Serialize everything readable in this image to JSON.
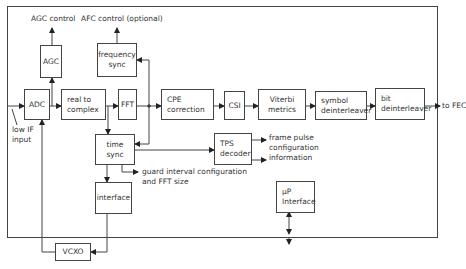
{
  "diagram": {
    "blocks": {
      "adc": "ADC",
      "agc": "AGC",
      "real_to_complex": [
        "real to",
        "complex"
      ],
      "fft": "FFT",
      "frequency_sync": [
        "frequency",
        "sync"
      ],
      "cpe_correction": [
        "CPE",
        "correction"
      ],
      "csi": "CSI",
      "viterbi_metrics": [
        "Viterbi",
        "metrics"
      ],
      "symbol_deinterleaver": [
        "symbol",
        "deinterleaver"
      ],
      "bit_deinterleaver": [
        "bit",
        "deinterleaver"
      ],
      "time_sync": [
        "time",
        "sync"
      ],
      "tps_decoder": [
        "TPS",
        "decoder"
      ],
      "interface": "interface",
      "up_interface": [
        "μP",
        "Interface"
      ],
      "vcxo": "VCXO"
    },
    "labels": {
      "agc_control": "AGC control",
      "afc_control": "AFC control (optional)",
      "low_if_input": [
        "low IF",
        "input"
      ],
      "to_fec": "to FEC",
      "tps_outputs": [
        "frame pulse",
        "configuration",
        "information"
      ],
      "guard_interval": [
        "guard interval configuration",
        "and FFT size"
      ]
    },
    "colors": {
      "line": "#444444",
      "text": "#333333",
      "background": "#ffffff"
    }
  }
}
